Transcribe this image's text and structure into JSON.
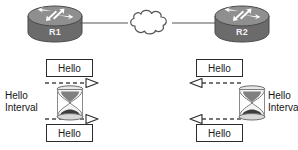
{
  "diagram": {
    "background_color": "#ffffff",
    "line_color": "#555555",
    "box_border_color": "#2b2b2b",
    "router_body_color": "#6e6e6e",
    "router_top_color": "#8a8a8a",
    "router_arrow_color": "#ffffff",
    "hourglass_frame_color": "#7d7d7d",
    "hourglass_sand_color": "#3d3d3d",
    "text_color": "#1a1a1a"
  },
  "routers": [
    {
      "id": "r1",
      "label": "R1",
      "icon": "router-icon",
      "side": "left"
    },
    {
      "id": "r2",
      "label": "R2",
      "icon": "router-icon",
      "side": "right"
    }
  ],
  "network": {
    "cloud_icon": "cloud-icon",
    "cloud_label": ""
  },
  "messages": [
    {
      "id": "hello-top-left",
      "label": "Hello",
      "side": "left",
      "position": "top",
      "direction": "right"
    },
    {
      "id": "hello-bottom-left",
      "label": "Hello",
      "side": "left",
      "position": "bottom",
      "direction": "right"
    },
    {
      "id": "hello-top-right",
      "label": "Hello",
      "side": "right",
      "position": "top",
      "direction": "left"
    },
    {
      "id": "hello-bottom-right",
      "label": "Hello",
      "side": "right",
      "position": "bottom",
      "direction": "left"
    }
  ],
  "timers": [
    {
      "id": "timer-left",
      "icon": "hourglass-icon",
      "label_line1": "Hello",
      "label_line2": "Interval",
      "label_side": "left"
    },
    {
      "id": "timer-right",
      "icon": "hourglass-icon",
      "label_line1": "Hello",
      "label_line2": "Interval",
      "label_side": "right"
    }
  ]
}
